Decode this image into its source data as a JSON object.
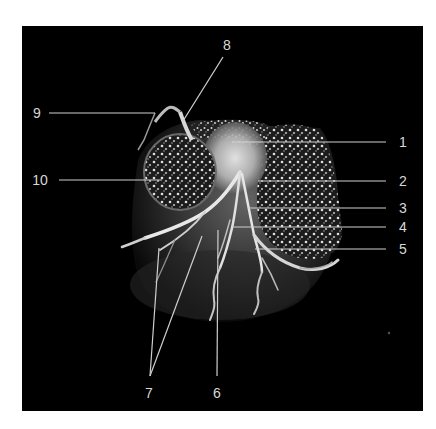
{
  "figure": {
    "background": "#000000",
    "page_background": "#ffffff",
    "label_color": "#d8d8d8",
    "leader_color": "#cfcfcf"
  },
  "labels": [
    {
      "id": "1",
      "text": "1",
      "x": 403,
      "y": 142
    },
    {
      "id": "2",
      "text": "2",
      "x": 403,
      "y": 181
    },
    {
      "id": "3",
      "text": "3",
      "x": 403,
      "y": 208
    },
    {
      "id": "4",
      "text": "4",
      "x": 403,
      "y": 227
    },
    {
      "id": "5",
      "text": "5",
      "x": 403,
      "y": 249
    },
    {
      "id": "6",
      "text": "6",
      "x": 217,
      "y": 393
    },
    {
      "id": "7",
      "text": "7",
      "x": 149,
      "y": 393
    },
    {
      "id": "8",
      "text": "8",
      "x": 227,
      "y": 45
    },
    {
      "id": "9",
      "text": "9",
      "x": 37,
      "y": 113
    },
    {
      "id": "10",
      "text": "10",
      "x": 40,
      "y": 180
    }
  ]
}
